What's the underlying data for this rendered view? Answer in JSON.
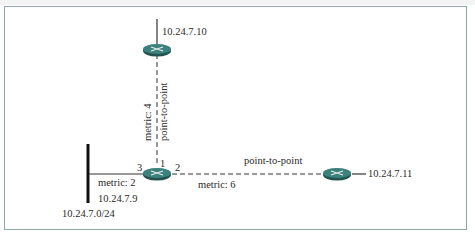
{
  "diagram": {
    "colors": {
      "router_fill": "#2f6f6a",
      "router_top": "#4a9691",
      "router_cross": "#dfe9e8",
      "frame_border": "#8fa7a6",
      "line": "#333333"
    },
    "routers": [
      {
        "id": "router-top",
        "address": "10.24.7.10"
      },
      {
        "id": "router-center"
      },
      {
        "id": "router-right",
        "address": "10.24.7.11"
      }
    ],
    "network": {
      "subnet": "10.24.7.0/24",
      "address": "10.24.7.9",
      "metric": "metric: 2"
    },
    "links": {
      "vertical": {
        "metric": "metric: 4",
        "type": "point-to-point"
      },
      "horizontal": {
        "metric": "metric: 6",
        "type": "point-to-point"
      }
    },
    "interfaces": {
      "if1": "1",
      "if2": "2",
      "if3": "3"
    }
  }
}
